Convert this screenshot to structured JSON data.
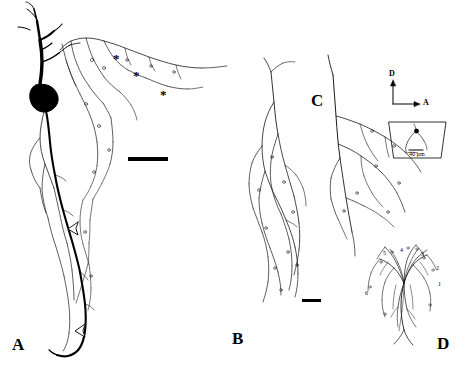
{
  "figure": {
    "background_color": "#ffffff",
    "ink_color": "#000000",
    "panels": [
      {
        "id": "A",
        "label": "A",
        "x": 12,
        "y": 336,
        "description": "camera-lucida drawing of a filled neuron with dark soma, ascending dendrites and a long descending axon"
      },
      {
        "id": "B",
        "label": "B",
        "x": 232,
        "y": 330,
        "description": "axonal arborization field, elongated vertical terminal field"
      },
      {
        "id": "C",
        "label": "C",
        "x": 311,
        "y": 92,
        "description": "axon collateral arborization, horizontal terminal field"
      },
      {
        "id": "D",
        "label": "D",
        "x": 437,
        "y": 335,
        "description": "fan-shaped terminal arbor with numbered branches"
      }
    ],
    "asterisks": [
      {
        "label": "*",
        "x": 113,
        "y": 52
      },
      {
        "label": "*",
        "x": 133,
        "y": 69
      },
      {
        "label": "*",
        "x": 160,
        "y": 88
      }
    ],
    "arrows": [
      {
        "name": "open-arrowhead-upper",
        "x": 72,
        "y": 228,
        "angle": 200
      },
      {
        "name": "open-arrowhead-lower",
        "x": 78,
        "y": 330,
        "angle": 200
      }
    ],
    "scale_bars": [
      {
        "name": "scale-bar-panel-a",
        "x": 128,
        "y": 157,
        "width": 40,
        "height": 4
      },
      {
        "name": "scale-bar-panel-b",
        "x": 302,
        "y": 299,
        "width": 19,
        "height": 3
      }
    ],
    "orientation_key": {
      "name": "orientation-axes",
      "dorsal_label": "D",
      "anterior_label": "A",
      "origin_x": 393,
      "origin_y": 104,
      "arm_length": 24
    },
    "inset": {
      "name": "soma-inset",
      "scale_text": "40 µm",
      "x": 383,
      "y": 124,
      "width": 62,
      "height": 36
    },
    "branch_numbers": [
      {
        "label": "5",
        "x": 383,
        "y": 250
      },
      {
        "label": "4",
        "x": 400,
        "y": 247
      },
      {
        "label": "3",
        "x": 421,
        "y": 251
      },
      {
        "label": "6",
        "x": 365,
        "y": 290
      },
      {
        "label": "2",
        "x": 436,
        "y": 265
      },
      {
        "label": "1",
        "x": 438,
        "y": 281
      }
    ]
  }
}
